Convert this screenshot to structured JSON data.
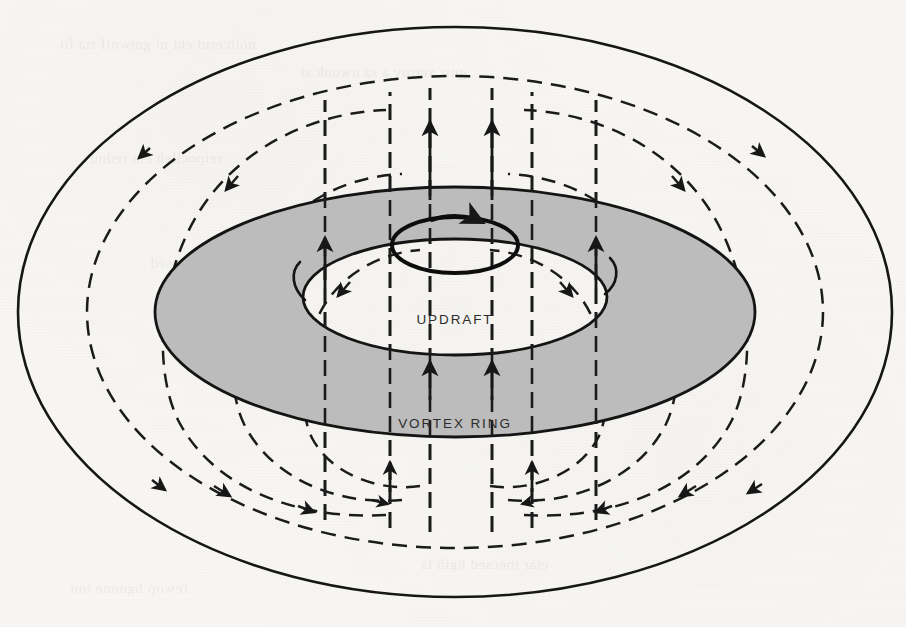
{
  "figure": {
    "background_color": "#f7f6f3",
    "ink_color": "#1a1a1a",
    "torus_fill_color": "#bcbcbc",
    "torus_stroke_color": "#141414",
    "labels": {
      "updraft": "UPDRAFT",
      "vortex_ring": "VORTEX RING"
    },
    "label_positions": {
      "updraft": {
        "x": 455,
        "y": 320
      },
      "vortex_ring": {
        "x": 455,
        "y": 424
      }
    },
    "geometry": {
      "center_x": 455,
      "center_y": 312,
      "outer_boundary_rx": 437,
      "outer_boundary_ry": 285,
      "inner_boundary_rx": 368,
      "inner_boundary_ry": 236,
      "torus_outer_rx": 300,
      "torus_outer_ry": 125,
      "torus_inner_rx": 152,
      "torus_inner_ry": 58,
      "core_ellipse_rx": 63,
      "core_ellipse_ry": 28,
      "core_ellipse_cy": 245
    },
    "elements": {
      "outer_solid_ellipse": "solid",
      "inner_dashed_ellipse": "dashed",
      "torus_band": "gray-filled annulus",
      "core_circulation_ellipse": "solid bold with arrowhead",
      "updraft_arrows": "vertical dashed lines with up arrowheads",
      "circulation_streamlines": "dashed closed loops with arrowheads"
    },
    "stream_loop_count": 8,
    "updraft_line_count": 6
  }
}
